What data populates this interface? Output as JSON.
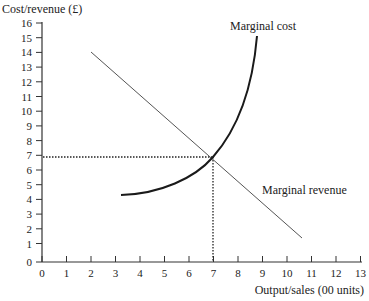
{
  "chart_data": {
    "type": "line",
    "title": "",
    "xlabel": "Output/sales (00 units)",
    "ylabel": "Cost/revenue (£)",
    "xlim": [
      0,
      13
    ],
    "ylim": [
      0,
      16
    ],
    "x_ticks": [
      "0",
      "1",
      "2",
      "3",
      "4",
      "5",
      "6",
      "7",
      "8",
      "9",
      "10",
      "11",
      "12",
      "13"
    ],
    "y_ticks": [
      "0",
      "1",
      "2",
      "3",
      "4",
      "5",
      "6",
      "7",
      "8",
      "9",
      "10",
      "11",
      "12",
      "13",
      "14",
      "15",
      "16"
    ],
    "grid": false,
    "legend": "none (curves labelled inline)",
    "series": [
      {
        "name": "Marginal cost",
        "style": "thick curve, convex, rising steeply",
        "points": [
          [
            3.3,
            4.4
          ],
          [
            4.5,
            4.8
          ],
          [
            5.5,
            5.4
          ],
          [
            6.3,
            6.1
          ],
          [
            7.0,
            6.8
          ],
          [
            7.6,
            7.8
          ],
          [
            8.1,
            9.0
          ],
          [
            8.5,
            10.6
          ],
          [
            8.75,
            12.3
          ],
          [
            8.9,
            13.4
          ]
        ]
      },
      {
        "name": "Marginal revenue",
        "style": "thin straight line, downward sloping",
        "points": [
          [
            2.0,
            14.0
          ],
          [
            10.7,
            1.5
          ]
        ]
      }
    ],
    "annotations": [
      {
        "type": "intersection",
        "x": 7,
        "y": 6.8,
        "note": "MC = MR"
      },
      {
        "type": "dotted-guide",
        "from": [
          0,
          6.8
        ],
        "to": [
          7,
          6.8
        ]
      },
      {
        "type": "dotted-guide",
        "from": [
          7,
          6.8
        ],
        "to": [
          7,
          0
        ]
      }
    ]
  },
  "labels": {
    "y_axis": "Cost/revenue (£)",
    "x_axis": "Output/sales (00 units)",
    "mc": "Marginal cost",
    "mr": "Marginal revenue"
  },
  "ticks": {
    "x": [
      "0",
      "1",
      "2",
      "3",
      "4",
      "5",
      "6",
      "7",
      "8",
      "9",
      "10",
      "11",
      "12",
      "13"
    ],
    "y": [
      "16",
      "15",
      "14",
      "13",
      "12",
      "11",
      "10",
      "9",
      "8",
      "7",
      "6",
      "5",
      "4",
      "3",
      "2",
      "1",
      "0"
    ]
  },
  "colors": {
    "axis": "#333333",
    "mc": "#1a1a1a",
    "mr": "#555555",
    "text": "#222222"
  }
}
